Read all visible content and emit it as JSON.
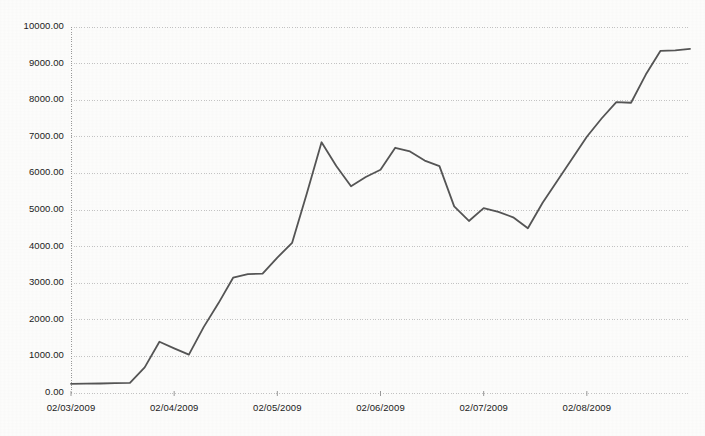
{
  "chart_data": {
    "type": "line",
    "title": "",
    "subtitle": "",
    "xlabel": "",
    "ylabel": "",
    "grid": true,
    "legend": false,
    "legend_position": "none",
    "line_color": "#555555",
    "background_color": "#fdfdfc",
    "gridline_color": "#bfbfbf",
    "axis_color": "#9a9a9a",
    "ylim": [
      0,
      10000
    ],
    "ytick_labels": [
      "0.00",
      "1000.00",
      "2000.00",
      "3000.00",
      "4000.00",
      "5000.00",
      "6000.00",
      "7000.00",
      "8000.00",
      "9000.00",
      "10000.00"
    ],
    "ytick_values": [
      0,
      1000,
      2000,
      3000,
      4000,
      5000,
      6000,
      7000,
      8000,
      9000,
      10000
    ],
    "xtick_labels": [
      "02/03/2009",
      "02/04/2009",
      "02/05/2009",
      "02/06/2009",
      "02/07/2009",
      "02/08/2009"
    ],
    "xtick_positions": [
      0,
      7,
      14,
      21,
      28,
      35
    ],
    "series": [
      {
        "name": "value",
        "values": [
          250,
          255,
          260,
          270,
          275,
          700,
          1400,
          1220,
          1050,
          1800,
          2450,
          3150,
          3250,
          3260,
          3700,
          4100,
          5450,
          6850,
          6200,
          5650,
          5900,
          6100,
          6700,
          6600,
          6350,
          6200,
          5100,
          4700,
          5050,
          4950,
          4800,
          4500,
          5200,
          5800,
          6400,
          7000,
          7500,
          7950,
          7930,
          8700,
          9350,
          9360,
          9400
        ]
      }
    ],
    "annotations": []
  }
}
